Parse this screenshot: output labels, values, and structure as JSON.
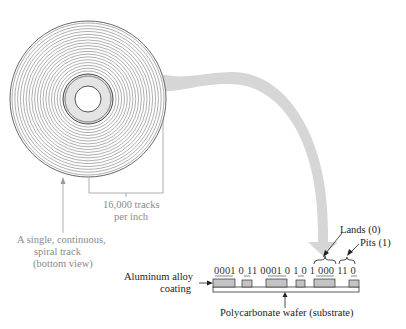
{
  "diagram": {
    "disk": {
      "center": [
        88,
        99
      ],
      "outer_radius": 78,
      "track_count": 18,
      "hole_radius": 13,
      "hub_radius": 23,
      "track_color": "#8c8c8c",
      "hub_fill": "#e4e4e4"
    },
    "arrow_color": "#d4d4d4",
    "labels": {
      "tracks_per_inch_line1": "16,000 tracks",
      "tracks_per_inch_line2": "per inch",
      "spiral_line1": "A single, continuous,",
      "spiral_line2": "spiral track",
      "spiral_line3": "(bottom view)",
      "aluminum_line1": "Aluminum alloy",
      "aluminum_line2": "coating",
      "lands": "Lands (0)",
      "pits": "Pits (1)",
      "substrate": "Polycarbonate wafer (substrate)"
    },
    "bit_groups": [
      "0 0 0 1",
      "0",
      "1 1",
      "0 0 0 1",
      "0",
      "1",
      "0",
      "1",
      "0 0 0",
      "1 1",
      "0"
    ],
    "bit_string": "0001 0 11 0001 0 1 0 1 000 11 0",
    "coating_color": "#c4c4c4"
  }
}
